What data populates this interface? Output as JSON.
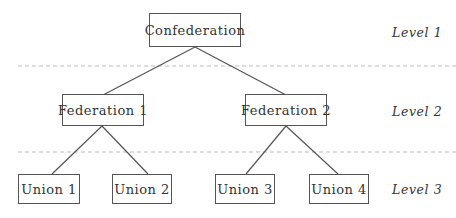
{
  "diagram": {
    "type": "hierarchy-tree",
    "nodes": {
      "root": {
        "label": "Confederation"
      },
      "fed1": {
        "label": "Federation 1"
      },
      "fed2": {
        "label": "Federation 2"
      },
      "u1": {
        "label": "Union 1"
      },
      "u2": {
        "label": "Union 2"
      },
      "u3": {
        "label": "Union 3"
      },
      "u4": {
        "label": "Union 4"
      }
    },
    "edges": [
      [
        "root",
        "fed1"
      ],
      [
        "root",
        "fed2"
      ],
      [
        "fed1",
        "u1"
      ],
      [
        "fed1",
        "u2"
      ],
      [
        "fed2",
        "u3"
      ],
      [
        "fed2",
        "u4"
      ]
    ],
    "levels": [
      "Level 1",
      "Level 2",
      "Level 3"
    ]
  },
  "colors": {
    "line": "#555555",
    "dash": "#bbbbbb",
    "text": "#333333"
  }
}
